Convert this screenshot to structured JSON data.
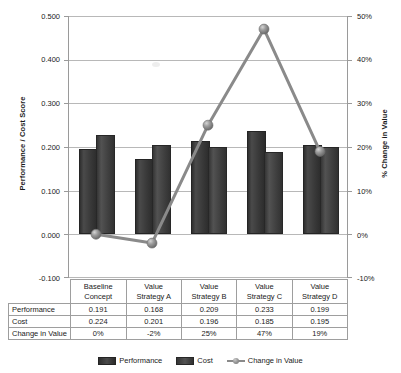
{
  "chart_data": {
    "type": "bar",
    "title": "",
    "categories": [
      "Baseline Concept",
      "Value Strategy A",
      "Value Strategy B",
      "Value Strategy C",
      "Value Strategy D"
    ],
    "category_lines": [
      [
        "Baseline",
        "Concept"
      ],
      [
        "Value",
        "Strategy A"
      ],
      [
        "Value",
        "Strategy B"
      ],
      [
        "Value",
        "Strategy C"
      ],
      [
        "Value",
        "Strategy D"
      ]
    ],
    "series": [
      {
        "name": "Performance",
        "type": "bar",
        "axis": "left",
        "values": [
          0.191,
          0.168,
          0.209,
          0.233,
          0.199
        ]
      },
      {
        "name": "Cost",
        "type": "bar",
        "axis": "left",
        "values": [
          0.224,
          0.201,
          0.196,
          0.185,
          0.195
        ]
      },
      {
        "name": "Change in Value",
        "type": "line",
        "axis": "right",
        "values": [
          0,
          -0.02,
          0.25,
          0.47,
          0.19
        ]
      }
    ],
    "xlabel": "",
    "ylabel": "Performance / Cost Score",
    "y2label": "% Change in Value",
    "ylim": [
      -0.1,
      0.5
    ],
    "y2lim": [
      -0.1,
      0.5
    ],
    "yticks": [
      "-0.100",
      "0.000",
      "0.100",
      "0.200",
      "0.300",
      "0.400",
      "0.500"
    ],
    "y2ticks": [
      "-10%",
      "0%",
      "10%",
      "20%",
      "30%",
      "40%",
      "50%"
    ],
    "grid": true,
    "legend_position": "bottom",
    "colors": {
      "performance": "#3a3a3a",
      "cost": "#454545",
      "change_in_value_line": "#8a8a8a",
      "gridline": "#b8b8b8",
      "axis": "#9a9a9a"
    }
  },
  "axes": {
    "left_title": "Performance / Cost Score",
    "right_title": "% Change in Value",
    "left_ticks": [
      "0.500",
      "0.400",
      "0.300",
      "0.200",
      "0.100",
      "0.000",
      "-0.100"
    ],
    "right_ticks": [
      "50%",
      "40%",
      "30%",
      "20%",
      "10%",
      "0%",
      "-10%"
    ]
  },
  "legend": {
    "items": [
      {
        "label": "Performance",
        "marker": "bar-swatch-dark"
      },
      {
        "label": "Cost",
        "marker": "bar-swatch-light"
      },
      {
        "label": "Change in Value",
        "marker": "line-marker-sphere"
      }
    ]
  },
  "table": {
    "corner": "",
    "columns": [
      {
        "line1": "Baseline",
        "line2": "Concept"
      },
      {
        "line1": "Value",
        "line2": "Strategy A"
      },
      {
        "line1": "Value",
        "line2": "Strategy B"
      },
      {
        "line1": "Value",
        "line2": "Strategy C"
      },
      {
        "line1": "Value",
        "line2": "Strategy D"
      }
    ],
    "rows": [
      {
        "label": "Performance",
        "values": [
          "0.191",
          "0.168",
          "0.209",
          "0.233",
          "0.199"
        ]
      },
      {
        "label": "Cost",
        "values": [
          "0.224",
          "0.201",
          "0.196",
          "0.185",
          "0.195"
        ]
      },
      {
        "label": "Change in Value",
        "values": [
          "0%",
          "-2%",
          "25%",
          "47%",
          "19%"
        ]
      }
    ]
  }
}
